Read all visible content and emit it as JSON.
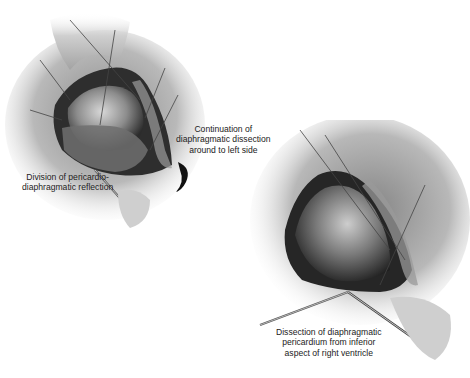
{
  "figure": {
    "panels": [
      {
        "name": "upper-left-panel",
        "description": "Heart exposure with pericardium opened, instrument dividing pericardio-diaphragmatic reflection",
        "labels": [
          {
            "id": "continuation-label",
            "lines": [
              "Continuation of",
              "diaphragmatic dissection",
              "around to left side"
            ]
          },
          {
            "id": "division-label",
            "lines": [
              "Division of pericardio-",
              "diaphragmatic reflection"
            ]
          }
        ],
        "arrow": "curved-arrow"
      },
      {
        "name": "lower-right-panel",
        "description": "Heart elevated with forceps and scissors dissecting diaphragmatic pericardium",
        "labels": [
          {
            "id": "dissection-label",
            "lines": [
              "Dissection of diaphragmatic",
              "pericardium from inferior",
              "aspect of right ventricle"
            ]
          }
        ]
      }
    ],
    "colors": {
      "background": "#ffffff",
      "text": "#222222",
      "tissue_dark": "#2a2a2a",
      "tissue_mid": "#7a7a7a",
      "tissue_light": "#d6d6d6"
    }
  }
}
